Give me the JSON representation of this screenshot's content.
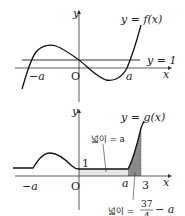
{
  "graphs": [
    {
      "name": "f",
      "axis_y_label": "y",
      "axis_x_label": "x",
      "curve_label": "y = f(x)",
      "line_label": "y = 1",
      "ticks": {
        "neg_a": "−a",
        "origin": "O",
        "a": "a"
      }
    },
    {
      "name": "g",
      "axis_y_label": "y",
      "axis_x_label": "x",
      "curve_label": "y = g(x)",
      "value_one": "1",
      "ticks": {
        "neg_a": "−a",
        "origin": "O",
        "a": "a",
        "three": "3"
      },
      "area_label_1": "넓이 = a",
      "area_label_2_prefix": "넓이 =",
      "area_label_2_num": "37",
      "area_label_2_den": "4",
      "area_label_2_suffix": "− a"
    }
  ],
  "colors": {
    "stroke": "#222222",
    "light_fill": "#e6e6e6",
    "dark_fill": "#8a8a8a"
  }
}
